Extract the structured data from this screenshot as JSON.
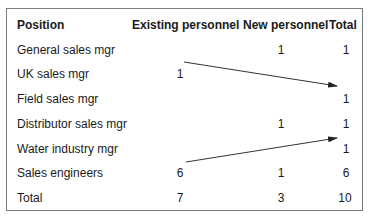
{
  "table": {
    "headers": [
      "Position",
      "Existing personnel",
      "New personnel",
      "Total"
    ],
    "rows": [
      {
        "position": "General sales mgr",
        "existing": "",
        "new": "1",
        "total": "1"
      },
      {
        "position": "UK sales mgr",
        "existing": "1",
        "new": "",
        "total": ""
      },
      {
        "position": "Field sales mgr",
        "existing": "",
        "new": "",
        "total": "1"
      },
      {
        "position": "Distributor sales mgr",
        "existing": "",
        "new": "1",
        "total": "1"
      },
      {
        "position": "Water industry mgr",
        "existing": "",
        "new": "",
        "total": "1"
      },
      {
        "position": "Sales engineers",
        "existing": "6",
        "new": "1",
        "total": "6"
      },
      {
        "position": "Total",
        "existing": "7",
        "new": "3",
        "total": "10"
      }
    ]
  },
  "annotations": {
    "arrows": [
      {
        "from": "UK sales mgr (existing)",
        "to": "Field sales mgr (total)"
      },
      {
        "from": "Sales engineers (existing)",
        "to": "Water industry mgr (total)"
      }
    ],
    "line_color": "#333333"
  }
}
